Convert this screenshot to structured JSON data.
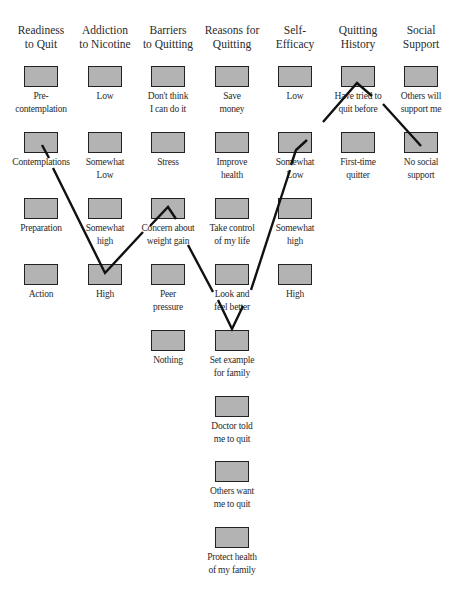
{
  "diagram": {
    "columns": [
      {
        "id": "readiness",
        "header": [
          "Readiness",
          "to Quit"
        ],
        "options": [
          [
            "Pre-",
            "contemplation"
          ],
          [
            "Contemplations"
          ],
          [
            "Preparation"
          ],
          [
            "Action"
          ]
        ]
      },
      {
        "id": "addiction",
        "header": [
          "Addiction",
          "to Nicotine"
        ],
        "options": [
          [
            "Low"
          ],
          [
            "Somewhat",
            "Low"
          ],
          [
            "Somewhat",
            "high"
          ],
          [
            "High"
          ]
        ]
      },
      {
        "id": "barriers",
        "header": [
          "Barriers",
          "to Quitting"
        ],
        "options": [
          [
            "Don't think",
            "I can do it"
          ],
          [
            "Stress"
          ],
          [
            "Concern about",
            "weight gain"
          ],
          [
            "Peer",
            "pressure"
          ],
          [
            "Nothing"
          ]
        ]
      },
      {
        "id": "reasons",
        "header": [
          "Reasons for",
          "Quitting"
        ],
        "options": [
          [
            "Save",
            "money"
          ],
          [
            "Improve",
            "health"
          ],
          [
            "Take control",
            "of my life"
          ],
          [
            "Look and",
            "feel better"
          ],
          [
            "Set example",
            "for family"
          ],
          [
            "Doctor told",
            "me to quit"
          ],
          [
            "Others want",
            "me to quit"
          ],
          [
            "Protect health",
            "of my family"
          ]
        ]
      },
      {
        "id": "self-efficacy",
        "header": [
          "Self-",
          "Efficacy"
        ],
        "options": [
          [
            "Low"
          ],
          [
            "Somewhat",
            "Low"
          ],
          [
            "Somewhat",
            "high"
          ],
          [
            "High"
          ]
        ]
      },
      {
        "id": "quitting-history",
        "header": [
          "Quitting",
          "History"
        ],
        "options": [
          [
            "Have tried to",
            "quit before"
          ],
          [
            "First-time",
            "quitter"
          ]
        ]
      },
      {
        "id": "social-support",
        "header": [
          "Social",
          "Support"
        ],
        "options": [
          [
            "Others will",
            "support me"
          ],
          [
            "No social",
            "support"
          ]
        ]
      }
    ],
    "selected_path": [
      {
        "column": "Readiness to Quit",
        "option": "Contemplations"
      },
      {
        "column": "Addiction to Nicotine",
        "option": "High"
      },
      {
        "column": "Barriers to Quitting",
        "option": "Concern about weight gain"
      },
      {
        "column": "Reasons for Quitting",
        "option": "Set example for family"
      },
      {
        "column": "Self-Efficacy",
        "option": "Somewhat Low"
      },
      {
        "column": "Quitting History",
        "option": "Have tried to quit before"
      },
      {
        "column": "Social Support",
        "option": "No social support"
      }
    ],
    "colors": {
      "box_fill": "#b3b3b3",
      "box_border": "#222222",
      "path_line": "#111111"
    }
  }
}
